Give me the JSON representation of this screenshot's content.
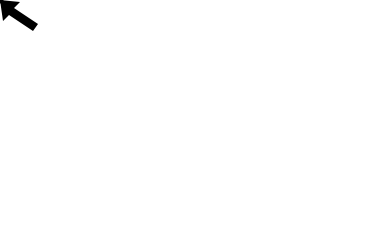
{
  "canvas": {
    "width": 377,
    "height": 232,
    "background": "#ffffff"
  },
  "shapes": {
    "selected_star": {
      "type": "star",
      "points": "117,37 138,104 208,104 152,147 172,215 117,174 61,215 82,147 25,104 95,104",
      "stroke": "#555555",
      "style": "solid"
    },
    "drag_preview_star": {
      "type": "star",
      "points": "266,35 287,104 357,104 301,147 321,215 266,175 210,215 231,147 175,104 245,104",
      "stroke": "#8a8a8a",
      "style": "dashed"
    }
  },
  "selection_handles": {
    "color": "#6b6b6b",
    "rotation_handle": {
      "x": 117,
      "y": 17
    },
    "corner_handles": [
      {
        "name": "top-left",
        "x": 25,
        "y": 36
      },
      {
        "name": "top-right",
        "x": 208,
        "y": 36
      },
      {
        "name": "bottom-left",
        "x": 25,
        "y": 216
      },
      {
        "name": "bottom-right",
        "x": 208,
        "y": 216
      }
    ],
    "edge_handles": [
      {
        "name": "top",
        "x": 117,
        "y": 36
      },
      {
        "name": "left",
        "x": 25,
        "y": 127
      },
      {
        "name": "right",
        "x": 208,
        "y": 127
      },
      {
        "name": "bottom",
        "x": 117,
        "y": 216
      }
    ]
  },
  "cursor": {
    "type": "move-arrow-icon",
    "tip_x": 255,
    "tip_y": 129,
    "color": "#000000"
  }
}
